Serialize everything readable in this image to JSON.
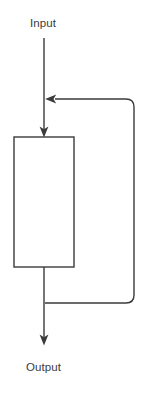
{
  "diagram": {
    "type": "block-diagram-feedback-loop",
    "background_color": "#ffffff",
    "stroke_color": "#3b3b3b",
    "block_fill_color": "#ffffff",
    "stroke_width": 1.4,
    "labels": {
      "input": "Input",
      "output": "Output"
    },
    "block": {
      "label": "",
      "x": 14,
      "y": 137,
      "width": 60,
      "height": 130,
      "fill": "#ffffff",
      "stroke": "#3b3b3b"
    },
    "nodes": [
      {
        "name": "input-label",
        "text": "Input",
        "x": 30,
        "y": 17
      },
      {
        "name": "output-label",
        "text": "Output",
        "x": 26,
        "y": 361
      }
    ],
    "edges": [
      {
        "name": "input-to-junction",
        "from": "input-label",
        "to": "summing-junction",
        "orientation": "vertical",
        "x": 44,
        "y_start": 38,
        "y_end": 99,
        "arrowhead": "none"
      },
      {
        "name": "junction-to-block",
        "from": "summing-junction",
        "to": "block",
        "orientation": "vertical",
        "x": 44,
        "y_start": 99,
        "y_end": 137,
        "arrowhead": "end-down"
      },
      {
        "name": "feedback-return",
        "from": "output-branch-point",
        "to": "summing-junction",
        "orientation": "loop-right",
        "x_right": 134,
        "y_top": 99,
        "y_bottom": 303,
        "corner_radius": 8,
        "arrowhead": "end-left"
      },
      {
        "name": "block-to-output",
        "from": "block",
        "to": "output-label",
        "orientation": "vertical",
        "x": 44,
        "y_start": 267,
        "y_end": 345,
        "arrowhead": "end-down"
      }
    ],
    "junctions": [
      {
        "name": "summing-junction",
        "x": 44,
        "y": 99
      },
      {
        "name": "output-branch-point",
        "x": 44,
        "y": 303
      }
    ]
  }
}
